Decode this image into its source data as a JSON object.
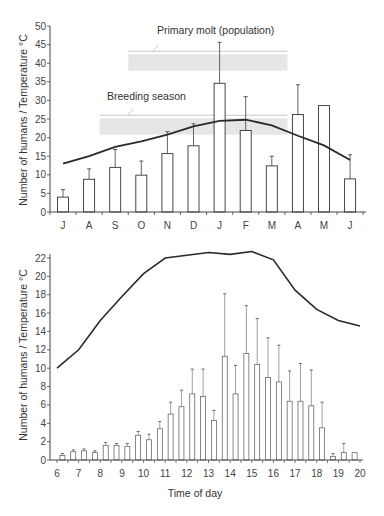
{
  "chart_data": [
    {
      "type": "bar",
      "title": "",
      "xlabel": "",
      "ylabel": "Number of humans / Temperature °C",
      "ylim": [
        0,
        50
      ],
      "yticks": [
        0,
        5,
        10,
        15,
        20,
        25,
        30,
        35,
        40,
        45,
        50
      ],
      "categories": [
        "J",
        "A",
        "S",
        "O",
        "N",
        "D",
        "J",
        "F",
        "M",
        "A",
        "M",
        "J"
      ],
      "grid": false,
      "legend": null,
      "series": [
        {
          "name": "Number of humans",
          "type": "bar",
          "values": [
            4.0,
            8.8,
            12.0,
            9.9,
            15.7,
            17.8,
            34.6,
            21.9,
            12.4,
            26.2,
            28.6,
            8.9
          ],
          "error_upper": [
            6.0,
            11.6,
            16.8,
            13.7,
            21.6,
            23.7,
            45.6,
            31.0,
            15.0,
            34.2,
            null,
            15.4
          ]
        },
        {
          "name": "Temperature °C",
          "type": "line",
          "values": [
            13.0,
            15.0,
            17.5,
            19.0,
            20.8,
            23.0,
            24.5,
            24.8,
            23.3,
            20.5,
            17.9,
            14.0
          ]
        }
      ],
      "annotations": [
        {
          "label": "Primary molt (population)",
          "band_start_index": 2.5,
          "band_end_index": 8.6,
          "y_low": 38.0,
          "y_high": 43.2
        },
        {
          "label": "Breeding season",
          "band_start_index": 1.4,
          "band_end_index": 8.6,
          "y_low": 20.8,
          "y_high": 26.0
        }
      ]
    },
    {
      "type": "bar",
      "title": "",
      "xlabel": "Time of day",
      "ylabel": "Number of humans / Temperature °C",
      "ylim": [
        0,
        22
      ],
      "yticks": [
        0,
        2,
        4,
        6,
        8,
        10,
        12,
        14,
        16,
        18,
        20,
        22
      ],
      "xticks": [
        6,
        7,
        8,
        9,
        10,
        11,
        12,
        13,
        14,
        15,
        16,
        17,
        18,
        19,
        20
      ],
      "xlim": [
        6,
        20
      ],
      "grid": false,
      "legend": null,
      "series": [
        {
          "name": "Number of humans",
          "type": "bar",
          "x": [
            6.25,
            6.75,
            7.25,
            7.75,
            8.25,
            8.75,
            9.25,
            9.75,
            10.25,
            10.75,
            11.25,
            11.75,
            12.25,
            12.75,
            13.25,
            13.75,
            14.25,
            14.75,
            15.25,
            15.75,
            16.25,
            16.75,
            17.25,
            17.75,
            18.25,
            18.75,
            19.25,
            19.75
          ],
          "values": [
            0.5,
            0.9,
            1.0,
            0.8,
            1.6,
            1.6,
            1.5,
            2.7,
            2.2,
            3.4,
            5.0,
            5.8,
            7.2,
            6.9,
            4.3,
            11.3,
            7.2,
            11.6,
            10.4,
            9.0,
            8.5,
            6.4,
            6.4,
            5.9,
            3.5,
            0.4,
            0.8,
            0.8
          ],
          "error_upper": [
            0.7,
            1.1,
            1.2,
            1.0,
            1.9,
            1.8,
            1.8,
            3.1,
            2.8,
            4.2,
            6.3,
            7.6,
            9.9,
            9.9,
            5.4,
            18.1,
            10.3,
            16.8,
            15.4,
            13.3,
            12.5,
            9.7,
            10.5,
            9.8,
            6.3,
            0.7,
            1.8,
            null
          ]
        },
        {
          "name": "Temperature °C",
          "type": "line",
          "x": [
            6,
            7,
            8,
            9,
            10,
            11,
            12,
            13,
            14,
            15,
            16,
            17,
            18,
            19,
            20
          ],
          "values": [
            10.0,
            12.0,
            15.2,
            17.8,
            20.3,
            22.0,
            22.3,
            22.6,
            22.4,
            22.7,
            21.8,
            18.5,
            16.4,
            15.2,
            14.6
          ]
        }
      ]
    }
  ],
  "top_chart": {
    "ylabel": "Number of humans / Temperature °C",
    "annotation_molt": "Primary molt (population)",
    "annotation_breeding": "Breeding season"
  },
  "bottom_chart": {
    "ylabel": "Number of humans / Temperature °C",
    "xlabel": "Time of day"
  }
}
